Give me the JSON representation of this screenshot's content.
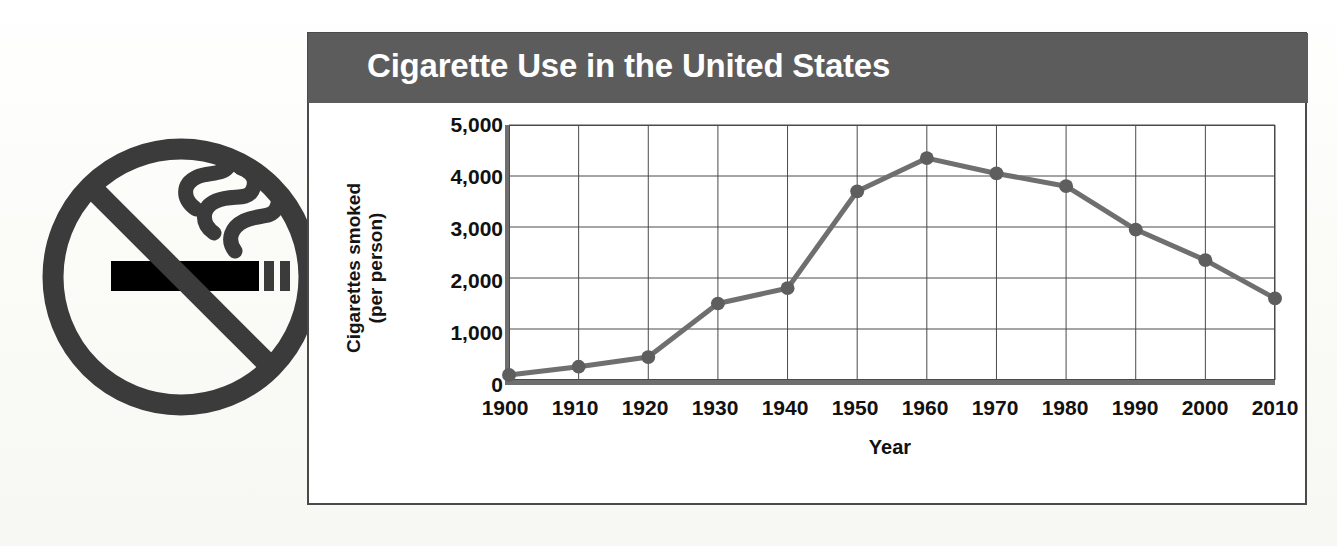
{
  "panel": {
    "title": "Cigarette Use in the United States",
    "banner_color": "#5c5c5c",
    "border_color": "#4a4a4a",
    "background_color": "#ffffff"
  },
  "icon": {
    "name": "no-smoking-sign",
    "ring_color": "#3b3b3b",
    "cigarette_color": "#000000"
  },
  "chart_data": {
    "type": "line",
    "title": "Cigarette Use in the United States",
    "xlabel": "Year",
    "ylabel": "Cigarettes smoked (per person)",
    "ylabel_lines": [
      "Cigarettes smoked",
      "(per person)"
    ],
    "categories": [
      "1900",
      "1910",
      "1920",
      "1930",
      "1940",
      "1950",
      "1960",
      "1970",
      "1980",
      "1990",
      "2000",
      "2010"
    ],
    "x": [
      1900,
      1910,
      1920,
      1930,
      1940,
      1950,
      1960,
      1970,
      1980,
      1990,
      2000,
      2010
    ],
    "values": [
      100,
      260,
      450,
      1500,
      1800,
      3700,
      4350,
      4050,
      3800,
      2950,
      2350,
      1600
    ],
    "ylim": [
      0,
      5000
    ],
    "xlim": [
      1900,
      2010
    ],
    "yticks": [
      5000,
      4000,
      3000,
      2000,
      1000,
      0
    ],
    "ytick_labels": [
      "5,000",
      "4,000",
      "3,000",
      "2,000",
      "1,000",
      "0"
    ],
    "grid": true,
    "legend": "none",
    "series_color": "#6f6f6f",
    "marker": "circle",
    "marker_color": "#5e5e5e"
  },
  "ghost": {
    "lines": [
      "Cigarette smoking",
      "This chart shows",
      "declined in recent",
      "tobacco use has"
    ]
  }
}
